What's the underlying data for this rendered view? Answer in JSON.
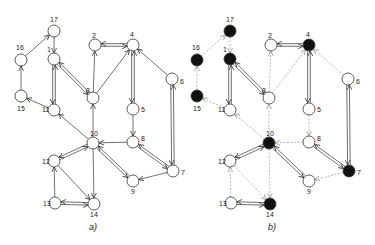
{
  "panels": [
    {
      "id": "a",
      "label": "a)",
      "label_pos": [
        93,
        230
      ],
      "offset_x": 0,
      "solid_all": true,
      "filled_nodes": []
    },
    {
      "id": "b",
      "label": "b)",
      "label_pos": [
        272,
        230
      ],
      "offset_x": 176,
      "solid_all": false,
      "filled_nodes": [
        17,
        16,
        1,
        15,
        4,
        10,
        7,
        14
      ]
    }
  ],
  "nodes": [
    {
      "id": 17,
      "x": 54,
      "y": 31,
      "lx": 50,
      "ly": 22
    },
    {
      "id": 16,
      "x": 21,
      "y": 60,
      "lx": 16,
      "ly": 50
    },
    {
      "id": 1,
      "x": 54,
      "y": 59,
      "lx": 47,
      "ly": 52
    },
    {
      "id": 15,
      "x": 21,
      "y": 96,
      "lx": 17,
      "ly": 111
    },
    {
      "id": 11,
      "x": 54,
      "y": 110,
      "lx": 42,
      "ly": 112
    },
    {
      "id": 3,
      "x": 93,
      "y": 98,
      "lx": 86,
      "ly": 93
    },
    {
      "id": 2,
      "x": 95,
      "y": 45,
      "lx": 92,
      "ly": 38
    },
    {
      "id": 4,
      "x": 133,
      "y": 45,
      "lx": 130,
      "ly": 37
    },
    {
      "id": 6,
      "x": 172,
      "y": 79,
      "lx": 180,
      "ly": 84
    },
    {
      "id": 5,
      "x": 133,
      "y": 109,
      "lx": 141,
      "ly": 112
    },
    {
      "id": 10,
      "x": 93,
      "y": 143,
      "lx": 90,
      "ly": 136
    },
    {
      "id": 8,
      "x": 133,
      "y": 142,
      "lx": 141,
      "ly": 141
    },
    {
      "id": 12,
      "x": 54,
      "y": 161,
      "lx": 42,
      "ly": 164
    },
    {
      "id": 7,
      "x": 173,
      "y": 171,
      "lx": 181,
      "ly": 175
    },
    {
      "id": 9,
      "x": 133,
      "y": 181,
      "lx": 131,
      "ly": 194
    },
    {
      "id": 13,
      "x": 55,
      "y": 203,
      "lx": 43,
      "ly": 206
    },
    {
      "id": 14,
      "x": 94,
      "y": 204,
      "lx": 90,
      "ly": 217
    }
  ],
  "edges": [
    {
      "from": 16,
      "to": 17,
      "double": false,
      "b_solid": false
    },
    {
      "from": 17,
      "to": 1,
      "double": false,
      "b_solid": false
    },
    {
      "from": 15,
      "to": 16,
      "double": false,
      "b_solid": false
    },
    {
      "from": 11,
      "to": 15,
      "double": false,
      "b_solid": false
    },
    {
      "from": 1,
      "to": 11,
      "double": true,
      "b_solid": true
    },
    {
      "from": 1,
      "to": 3,
      "double": true,
      "b_solid": true
    },
    {
      "from": 3,
      "to": 2,
      "double": false,
      "b_solid": false
    },
    {
      "from": 3,
      "to": 4,
      "double": false,
      "b_solid": false
    },
    {
      "from": 4,
      "to": 2,
      "double": true,
      "b_solid": true
    },
    {
      "from": 6,
      "to": 4,
      "double": false,
      "b_solid": false
    },
    {
      "from": 4,
      "to": 5,
      "double": true,
      "b_solid": true
    },
    {
      "from": 5,
      "to": 8,
      "double": false,
      "b_solid": false
    },
    {
      "from": 6,
      "to": 7,
      "double": true,
      "b_solid": true
    },
    {
      "from": 8,
      "to": 7,
      "double": true,
      "b_solid": true
    },
    {
      "from": 7,
      "to": 9,
      "double": false,
      "b_solid": false
    },
    {
      "from": 8,
      "to": 10,
      "double": false,
      "b_solid": false
    },
    {
      "from": 10,
      "to": 9,
      "double": true,
      "b_solid": true
    },
    {
      "from": 10,
      "to": 3,
      "double": false,
      "b_solid": false
    },
    {
      "from": 10,
      "to": 11,
      "double": false,
      "b_solid": false
    },
    {
      "from": 10,
      "to": 12,
      "double": true,
      "b_solid": true
    },
    {
      "from": 10,
      "to": 14,
      "double": false,
      "b_solid": false
    },
    {
      "from": 12,
      "to": 14,
      "double": false,
      "b_solid": false
    },
    {
      "from": 13,
      "to": 12,
      "double": false,
      "b_solid": false
    },
    {
      "from": 14,
      "to": 13,
      "double": true,
      "b_solid": true
    }
  ],
  "style": {
    "node_radius": 6,
    "stroke": "#333333",
    "dashed_stroke": "#9a9a9a",
    "filled": "#111111",
    "empty": "#ffffff"
  }
}
